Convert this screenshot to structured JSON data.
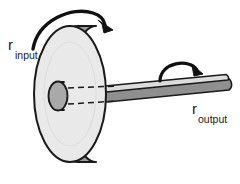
{
  "figure": {
    "background_color": "#ffffff",
    "width": 240,
    "height": 184
  },
  "labels": {
    "input": {
      "symbol": "r",
      "subscript": "input",
      "full_text": "r input"
    },
    "output": {
      "symbol": "r",
      "subscript": "output",
      "full_text": "r output"
    }
  },
  "parts": {
    "disk": {
      "name": "wheel-disk",
      "face_color": "#e9e9e9",
      "rim_color": "#9b9b9b",
      "outline_color": "#1a1a1a"
    },
    "hub": {
      "name": "hub-boss",
      "face_color": "#a9a9a9",
      "outline_color": "#1a1a1a"
    },
    "shaft": {
      "name": "axle-shaft",
      "top_color": "#d9d9d9",
      "side_color": "#8f8f8f",
      "outline_color": "#1a1a1a"
    },
    "center_lines": {
      "name": "axis-dashed-lines",
      "color": "#1a1a1a",
      "style": "dashed"
    }
  },
  "arrows": {
    "input_rotation": {
      "name": "input-rotation-arrow",
      "direction": "clockwise",
      "color": "#111111"
    },
    "output_rotation": {
      "name": "output-rotation-arrow",
      "direction": "clockwise",
      "color": "#111111"
    }
  }
}
